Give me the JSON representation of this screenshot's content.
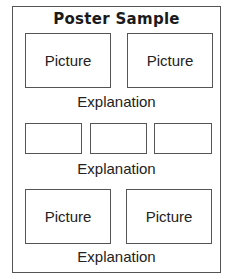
{
  "poster": {
    "title": "Poster Sample",
    "sections": [
      {
        "pictures": [
          {
            "label": "Picture"
          },
          {
            "label": "Picture"
          }
        ],
        "explanation": "Explanation"
      },
      {
        "pictures": [
          {
            "label": ""
          },
          {
            "label": ""
          },
          {
            "label": ""
          }
        ],
        "explanation": "Explanation"
      },
      {
        "pictures": [
          {
            "label": "Picture"
          },
          {
            "label": "Picture"
          }
        ],
        "explanation": "Explanation"
      }
    ]
  },
  "colors": {
    "border": "#555555",
    "background": "#ffffff",
    "text": "#222222"
  }
}
